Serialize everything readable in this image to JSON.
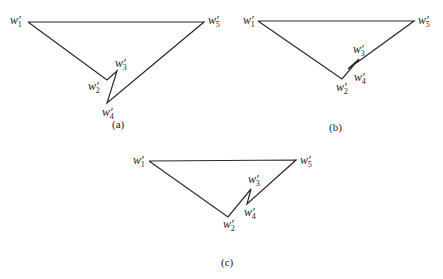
{
  "figure": {
    "panels": [
      {
        "caption": "(a)",
        "points": {
          "w1": [
            28,
            22
          ],
          "w2": [
            107,
            80
          ],
          "w3": [
            117,
            71
          ],
          "w4": [
            107,
            103
          ],
          "w5": [
            204,
            22
          ]
        },
        "labels": [
          {
            "base": "w",
            "prime": "′",
            "sub": "1",
            "x": 10,
            "y": 24
          },
          {
            "base": "w",
            "prime": "′",
            "sub": "5",
            "x": 208,
            "y": 24
          },
          {
            "base": "w",
            "prime": "′",
            "sub": "3",
            "x": 115,
            "y": 67
          },
          {
            "base": "w",
            "prime": "′",
            "sub": "2",
            "x": 88,
            "y": 90
          },
          {
            "base": "w",
            "prime": "′",
            "sub": "4",
            "x": 102,
            "y": 116
          }
        ],
        "caption_pos": [
          112,
          128
        ]
      },
      {
        "caption": "(b)",
        "points": {
          "w1": [
            258,
            21
          ],
          "w2": [
            342,
            79
          ],
          "w3": [
            359,
            59
          ],
          "w4": [
            348,
            69
          ],
          "w5": [
            414,
            21
          ]
        },
        "labels": [
          {
            "base": "w",
            "prime": "′",
            "sub": "1",
            "x": 243,
            "y": 24
          },
          {
            "base": "w",
            "prime": "′",
            "sub": "5",
            "x": 418,
            "y": 24
          },
          {
            "base": "w",
            "prime": "′",
            "sub": "3",
            "x": 353,
            "y": 53
          },
          {
            "base": "w",
            "prime": "′",
            "sub": "4",
            "x": 354,
            "y": 81
          },
          {
            "base": "w",
            "prime": "′",
            "sub": "2",
            "x": 336,
            "y": 91
          }
        ],
        "caption_pos": [
          329,
          131
        ]
      },
      {
        "caption": "(c)",
        "points": {
          "w1": [
            149,
            161
          ],
          "w2": [
            228,
            217
          ],
          "w3": [
            251,
            189
          ],
          "w4": [
            247,
            204
          ],
          "w5": [
            296,
            160
          ]
        },
        "labels": [
          {
            "base": "w",
            "prime": "′",
            "sub": "1",
            "x": 133,
            "y": 164
          },
          {
            "base": "w",
            "prime": "′",
            "sub": "5",
            "x": 300,
            "y": 164
          },
          {
            "base": "w",
            "prime": "′",
            "sub": "3",
            "x": 248,
            "y": 183
          },
          {
            "base": "w",
            "prime": "′",
            "sub": "4",
            "x": 244,
            "y": 216
          },
          {
            "base": "w",
            "prime": "′",
            "sub": "2",
            "x": 223,
            "y": 228
          }
        ],
        "caption_pos": [
          221,
          266
        ]
      }
    ]
  }
}
